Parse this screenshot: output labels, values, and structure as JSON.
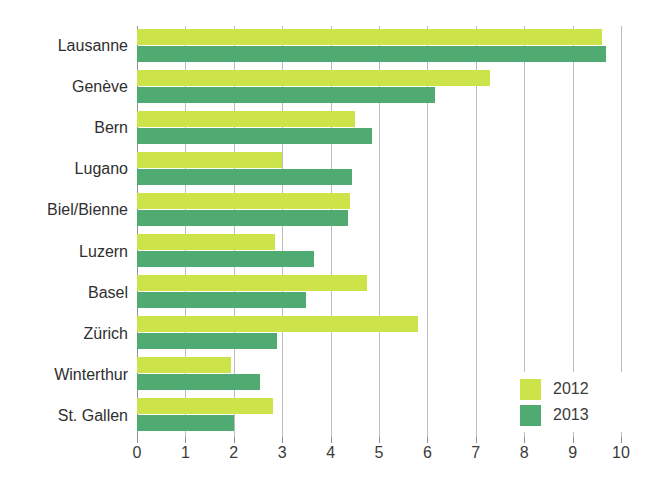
{
  "chart_data": {
    "type": "bar",
    "orientation": "horizontal",
    "title": "",
    "xlabel": "",
    "ylabel": "",
    "xlim": [
      0,
      10
    ],
    "xticks": [
      "0",
      "1",
      "2",
      "3",
      "4",
      "5",
      "6",
      "7",
      "8",
      "9",
      "10"
    ],
    "grid": true,
    "legend_position": "bottom-right",
    "categories": [
      "Lausanne",
      "Genève",
      "Bern",
      "Lugano",
      "Biel/Bienne",
      "Luzern",
      "Basel",
      "Zürich",
      "Winterthur",
      "St. Gallen"
    ],
    "series": [
      {
        "name": "2012",
        "color": "#cde34a",
        "values": [
          9.6,
          7.3,
          4.5,
          3.0,
          4.4,
          2.85,
          4.75,
          5.8,
          1.95,
          2.8
        ]
      },
      {
        "name": "2013",
        "color": "#4fab72",
        "values": [
          9.7,
          6.15,
          4.85,
          4.45,
          4.35,
          3.65,
          3.5,
          2.9,
          2.55,
          2.0
        ]
      }
    ]
  },
  "legend": {
    "entries": [
      {
        "label": "2012",
        "color": "#cde34a"
      },
      {
        "label": "2013",
        "color": "#4fab72"
      }
    ]
  },
  "colors": {
    "series_2012": "#cde34a",
    "series_2013": "#4fab72",
    "grid": "#b9bec4",
    "axis": "#8d9298",
    "text": "#3b3b3b",
    "background": "#ffffff"
  }
}
